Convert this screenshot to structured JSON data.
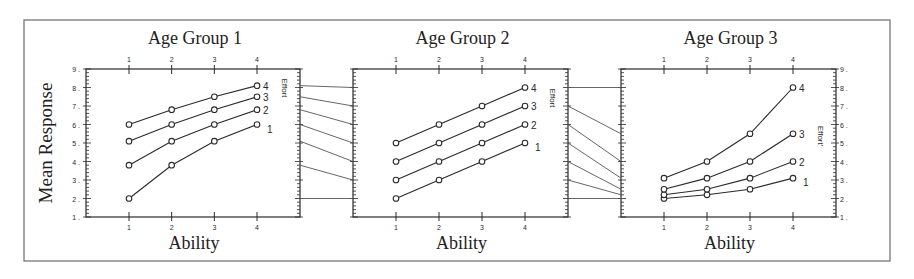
{
  "figure": {
    "ylabel": "Mean Response",
    "xlabel": "Ability",
    "effort_label": "Effort",
    "effort_label_transformed": "Effort'"
  },
  "chart_data": [
    {
      "type": "line",
      "title": "Age Group 1",
      "xlabel": "Ability",
      "ylabel": "Mean Response",
      "x": [
        1,
        2,
        3,
        4
      ],
      "ylim": [
        1,
        9
      ],
      "yticks": [
        1,
        2,
        3,
        4,
        5,
        6,
        7,
        8,
        9
      ],
      "legend_title": "Effort",
      "series": [
        {
          "name": "1",
          "values": [
            2.0,
            3.8,
            5.1,
            6.0
          ]
        },
        {
          "name": "2",
          "values": [
            3.8,
            5.1,
            6.0,
            6.8
          ]
        },
        {
          "name": "3",
          "values": [
            5.1,
            6.0,
            6.8,
            7.5
          ]
        },
        {
          "name": "4",
          "values": [
            6.0,
            6.8,
            7.5,
            8.1
          ]
        }
      ]
    },
    {
      "type": "line",
      "title": "Age Group 2",
      "xlabel": "Ability",
      "x": [
        1,
        2,
        3,
        4
      ],
      "ylim": [
        1,
        9
      ],
      "legend_title": "Effort",
      "series": [
        {
          "name": "1",
          "values": [
            2,
            3,
            4,
            5
          ]
        },
        {
          "name": "2",
          "values": [
            3,
            4,
            5,
            6
          ]
        },
        {
          "name": "3",
          "values": [
            4,
            5,
            6,
            7
          ]
        },
        {
          "name": "4",
          "values": [
            5,
            6,
            7,
            8
          ]
        }
      ]
    },
    {
      "type": "line",
      "title": "Age Group 3",
      "xlabel": "Ability",
      "x": [
        1,
        2,
        3,
        4
      ],
      "ylim": [
        1,
        9
      ],
      "yticks": [
        1,
        2,
        3,
        4,
        5,
        6,
        7,
        8,
        9
      ],
      "legend_title": "Effort'",
      "series": [
        {
          "name": "1",
          "values": [
            2.0,
            2.2,
            2.5,
            3.1
          ]
        },
        {
          "name": "2",
          "values": [
            2.2,
            2.5,
            3.1,
            4.0
          ]
        },
        {
          "name": "3",
          "values": [
            2.5,
            3.1,
            4.0,
            5.5
          ]
        },
        {
          "name": "4",
          "values": [
            3.1,
            4.0,
            5.5,
            8.0
          ]
        }
      ]
    }
  ],
  "connectors": [
    {
      "from_panel": 0,
      "to_panel": 1,
      "from": [
        8.1,
        7.5,
        6.8,
        6.0,
        5.1,
        3.8,
        2.0
      ],
      "to": [
        8,
        7,
        6,
        5,
        4,
        3,
        2
      ]
    },
    {
      "from_panel": 1,
      "to_panel": 2,
      "from": [
        8,
        7,
        6,
        5,
        4,
        3,
        2
      ],
      "to": [
        8.0,
        5.5,
        4.0,
        3.1,
        2.5,
        2.2,
        2.0
      ]
    }
  ],
  "layout": {
    "frame": [
      24,
      20,
      890,
      261
    ],
    "panels": [
      {
        "left": 86,
        "right": 300,
        "x1": 129,
        "x4": 257,
        "left_labels": true,
        "right_labels": false
      },
      {
        "left": 353,
        "right": 568,
        "x1": 396,
        "x4": 525,
        "left_labels": false,
        "right_labels": false
      },
      {
        "left": 621,
        "right": 836,
        "x1": 664,
        "x4": 793,
        "left_labels": false,
        "right_labels": true
      }
    ],
    "y_top": 69,
    "y_bottom": 217
  }
}
